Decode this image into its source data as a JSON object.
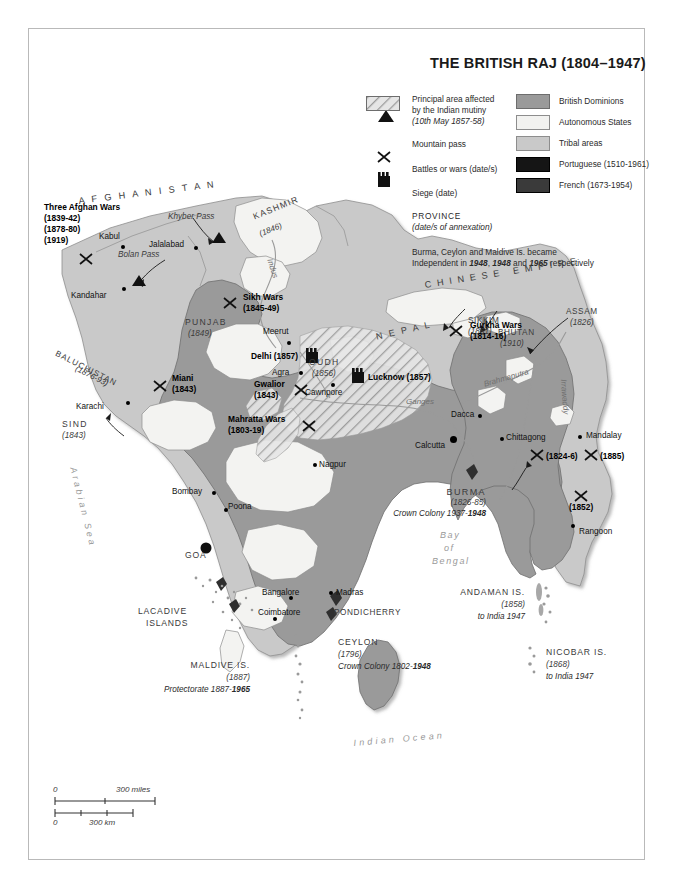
{
  "title": "THE BRITISH RAJ (1804–1947)",
  "legend": {
    "mutiny": {
      "line1": "Principal area affected",
      "line2": "by the Indian mutiny",
      "line3": "(10th May 1857-58)"
    },
    "mountain_pass": "Mountain pass",
    "battles": "Battles or wars (date/s)",
    "siege": "Siege (date)",
    "province": "PROVINCE",
    "province_sub": "(date/s of annexation)",
    "independence_line1": "Burma, Ceylon and Maldive Is. became",
    "independence_line2_a": "Independent in ",
    "independence_y1": "1948",
    "independence_sep1": ", ",
    "independence_y2": "1948",
    "independence_sep2": " and ",
    "independence_y3": "1965",
    "independence_line2_b": " respectively",
    "areas": [
      {
        "label": "British Dominions",
        "color": "#9a9a9a"
      },
      {
        "label": "Autonomous States",
        "color": "#f2f2f0"
      },
      {
        "label": "Tribal areas",
        "color": "#c9c9c9"
      },
      {
        "label": "Portuguese (1510-1961)",
        "color": "#151515"
      },
      {
        "label": "French (1673-1954)",
        "color": "#3a3a3a"
      }
    ]
  },
  "regions": {
    "afghanistan": "A F G H A N I S T A N",
    "chinese_empire": "C H I N E S E   E M P I R E",
    "kashmir": "KASHMIR",
    "kashmir_date": "(1846)",
    "punjab": "PUNJAB",
    "punjab_date": "(1849)",
    "baluchistan": "BALUCHISTAN",
    "baluchistan_date": "(1876-93)",
    "sind": "SIND",
    "sind_date": "(1843)",
    "oudh": "OUDH",
    "oudh_date": "(1856)",
    "nepal": "N E P A L",
    "sikkim": "SIKKIM",
    "sikkim_date": "(1861)",
    "bhutan": "BHUTAN",
    "bhutan_date": "(1910)",
    "assam": "ASSAM",
    "assam_date": "(1826)",
    "burma": "BURMA",
    "burma_date": "(1826-85)",
    "burma_note_a": "Crown Colony 1937-",
    "burma_note_y": "1948",
    "goa": "GOA",
    "pondicherry": "PONDICHERRY"
  },
  "cities": [
    {
      "name": "Kabul"
    },
    {
      "name": "Jalalabad"
    },
    {
      "name": "Kandahar"
    },
    {
      "name": "Karachi"
    },
    {
      "name": "Meerut"
    },
    {
      "name": "Agra"
    },
    {
      "name": "Cawnpore"
    },
    {
      "name": "Dacca"
    },
    {
      "name": "Calcutta"
    },
    {
      "name": "Chittagong"
    },
    {
      "name": "Mandalay"
    },
    {
      "name": "Rangoon"
    },
    {
      "name": "Nagpur"
    },
    {
      "name": "Bombay"
    },
    {
      "name": "Poona"
    },
    {
      "name": "Bangalore"
    },
    {
      "name": "Coimbatore"
    },
    {
      "name": "Madras"
    }
  ],
  "passes": [
    {
      "name": "Khyber Pass"
    },
    {
      "name": "Bolan Pass"
    }
  ],
  "rivers": [
    {
      "name": "Indus"
    },
    {
      "name": "Ganges"
    },
    {
      "name": "Brahmaputra"
    },
    {
      "name": "Irrawaddy"
    }
  ],
  "battles": [
    {
      "name": "Three Afghan Wars",
      "dates": [
        "(1839-42)",
        "(1878-80)",
        "(1919)"
      ]
    },
    {
      "name": "Sikh Wars",
      "dates": [
        "(1845-49)"
      ]
    },
    {
      "name": "Gurkha Wars",
      "dates": [
        "(1814-16)"
      ]
    },
    {
      "name": "Miani",
      "dates": [
        "(1843)"
      ]
    },
    {
      "name": "Gwalior",
      "dates": [
        "(1843)"
      ]
    },
    {
      "name": "Mahratta Wars",
      "dates": [
        "(1803-19)"
      ]
    },
    {
      "name": "",
      "dates": [
        "(1824-6)"
      ]
    },
    {
      "name": "",
      "dates": [
        "(1885)"
      ]
    },
    {
      "name": "",
      "dates": [
        "(1852)"
      ]
    }
  ],
  "sieges": [
    {
      "label": "Delhi (1857)"
    },
    {
      "label": "Lucknow (1857)"
    }
  ],
  "seas": {
    "arabian": "Arabian Sea",
    "bay_line1": "Bay",
    "bay_line2": "of",
    "bay_line3": "Bengal",
    "indian_ocean": "Indian Ocean"
  },
  "islands": {
    "lacadive_l1": "LACADIVE",
    "lacadive_l2": "ISLANDS",
    "maldive": "MALDIVE IS.",
    "maldive_date": "(1887)",
    "maldive_note_a": "Protectorate 1887-",
    "maldive_note_y": "1965",
    "ceylon": "CEYLON",
    "ceylon_date": "(1796)",
    "ceylon_note_a": "Crown Colony 1802-",
    "ceylon_note_y": "1948",
    "andaman": "ANDAMAN IS.",
    "andaman_date": "(1858)",
    "andaman_note": "to India 1947",
    "nicobar": "NICOBAR IS.",
    "nicobar_date": "(1868)",
    "nicobar_note": "to India 1947"
  },
  "scale": {
    "zero_miles": "0",
    "max_miles": "300 miles",
    "zero_km": "0",
    "max_km": "300 km"
  }
}
